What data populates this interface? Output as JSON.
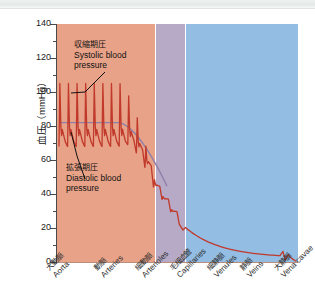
{
  "figure": {
    "background_bands": [
      {
        "name": "arterial",
        "color": "#e8a288"
      },
      {
        "name": "capillary",
        "color": "#b7aac6"
      },
      {
        "name": "venous",
        "color": "#93bde3"
      }
    ],
    "curve_color": "#c0392b",
    "mean_line_color": "#8e7fa8"
  },
  "annotations": {
    "systolic": {
      "jp": "収縮期圧",
      "en_line1": "Systolic blood",
      "en_line2": "pressure"
    },
    "diastolic": {
      "jp": "拡張期圧",
      "en_line1": "Diastolic blood",
      "en_line2": "pressure"
    }
  },
  "chart_data": {
    "type": "line",
    "title": "",
    "xlabel": "",
    "ylabel": "血圧（mmHg）",
    "ylim": [
      0,
      140
    ],
    "yticks": [
      0,
      20,
      40,
      60,
      80,
      100,
      120,
      140
    ],
    "ytick_labels": [
      "0",
      "20",
      "40",
      "60",
      "80",
      "100",
      "120",
      "140"
    ],
    "y_minor_ticks": [
      10,
      30,
      50,
      70,
      90,
      110,
      130
    ],
    "grid": false,
    "legend_position": "none",
    "categories": [
      {
        "jp": "大動脈",
        "en": "Aorta"
      },
      {
        "jp": "動脈",
        "en": "Arteries"
      },
      {
        "jp": "細動脈",
        "en": "Arterioles"
      },
      {
        "jp": "毛細血管",
        "en": "Capillaries"
      },
      {
        "jp": "細静脈",
        "en": "Venules"
      },
      {
        "jp": "静脈",
        "en": "Veins"
      },
      {
        "jp": "大静脈",
        "en": "Vena cavae"
      }
    ],
    "series": [
      {
        "name": "Systolic blood pressure",
        "values": [
          120,
          120,
          118,
          40,
          18,
          10,
          5
        ]
      },
      {
        "name": "Diastolic blood pressure",
        "values": [
          80,
          80,
          78,
          35,
          16,
          9,
          4
        ]
      },
      {
        "name": "Mean arterial pressure",
        "values": [
          93,
          92,
          90,
          37,
          17,
          9,
          4
        ]
      }
    ],
    "annotations_on_plot": [
      {
        "label": "収縮期圧 / Systolic blood pressure",
        "points_to_mmHg": 105
      },
      {
        "label": "拡張期圧 / Diastolic blood pressure",
        "points_to_mmHg": 72
      }
    ]
  }
}
